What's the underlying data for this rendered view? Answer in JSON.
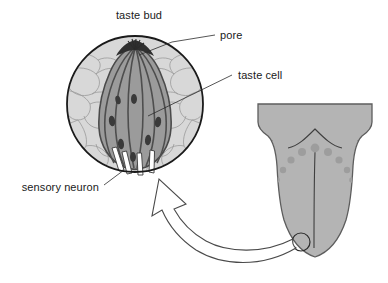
{
  "figure": {
    "background_color": "#ffffff",
    "labels": {
      "taste_bud": "taste bud",
      "pore": "pore",
      "taste_cell": "taste cell",
      "sensory_neuron": "sensory neuron"
    },
    "colors": {
      "epithelium_fill": "#d5d5d5",
      "epithelium_outline": "#8c8c8c",
      "taste_bud_fill": "#9a9a9a",
      "taste_cell_line": "#4a4a4a",
      "nucleus_fill": "#3a3a3a",
      "pore_fill": "#2e2e2e",
      "neuron_fill": "#ffffff",
      "neuron_outline": "#3b3b3b",
      "circle_outline": "#1a1a1a",
      "tongue_fill": "#b3b3b3",
      "tongue_outline": "#5d5d5d",
      "papilla_fill": "#9d9d9d",
      "arrow_outline": "#4a4a4a",
      "label_text": "#1a1a1a"
    },
    "structures": {
      "taste_bud_circle": {
        "cx": 135,
        "cy": 104,
        "r": 68
      },
      "tongue": {
        "cx": 315,
        "top": 104,
        "bottom": 258
      },
      "tongue_marker_circle": {
        "cx": 301,
        "cy": 242,
        "r": 9
      },
      "sensory_neuron_count": 4,
      "papillae_count": 9,
      "taste_cell_count": 7,
      "nuclei_count": 8
    }
  }
}
